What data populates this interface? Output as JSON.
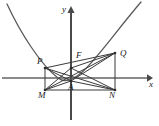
{
  "figure": {
    "type": "geometry-diagram",
    "width": 159,
    "height": 126,
    "stroke_color": "#3a3a3a",
    "axis_color": "#808080",
    "label_color": "#1a1a1a"
  },
  "axes": {
    "x_label": "x",
    "y_label": "y",
    "origin": {
      "x": 71,
      "y": 78
    },
    "x_axis": {
      "x1": 2,
      "y1": 78,
      "x2": 150,
      "y2": 78
    },
    "y_axis": {
      "x1": 71,
      "y1": 120,
      "x2": 71,
      "y2": 8
    }
  },
  "curve": {
    "name": "parabola",
    "vertex": {
      "x": 58,
      "y": 79
    },
    "left_end": {
      "x": 7,
      "y": 4
    },
    "right_end": {
      "x": 141,
      "y": 2
    }
  },
  "points": [
    {
      "id": "P",
      "label": "P",
      "x": 45,
      "y": 68,
      "label_x": 37,
      "label_y": 57
    },
    {
      "id": "F",
      "label": "F",
      "x": 71,
      "y": 68,
      "label_x": 76,
      "label_y": 51
    },
    {
      "id": "Q",
      "label": "Q",
      "x": 115,
      "y": 53,
      "label_x": 120,
      "label_y": 49
    },
    {
      "id": "A",
      "label": "A",
      "x": 71,
      "y": 81,
      "label_x": 69,
      "label_y": 83
    },
    {
      "id": "M",
      "label": "M",
      "x": 45,
      "y": 90,
      "label_x": 39,
      "label_y": 91
    },
    {
      "id": "N",
      "label": "N",
      "x": 115,
      "y": 90,
      "label_x": 110,
      "label_y": 91
    }
  ],
  "segments": [
    {
      "from": "P",
      "to": "M"
    },
    {
      "from": "Q",
      "to": "N"
    },
    {
      "from": "M",
      "to": "N"
    },
    {
      "from": "P",
      "to": "Q"
    },
    {
      "from": "P",
      "to": "N"
    },
    {
      "from": "Q",
      "to": "M"
    },
    {
      "from": "P",
      "to": "A"
    },
    {
      "from": "Q",
      "to": "A"
    },
    {
      "from": "M",
      "to": "F"
    },
    {
      "from": "N",
      "to": "F"
    },
    {
      "from": "F",
      "to": "Q"
    },
    {
      "from": "F",
      "to": "M"
    }
  ]
}
